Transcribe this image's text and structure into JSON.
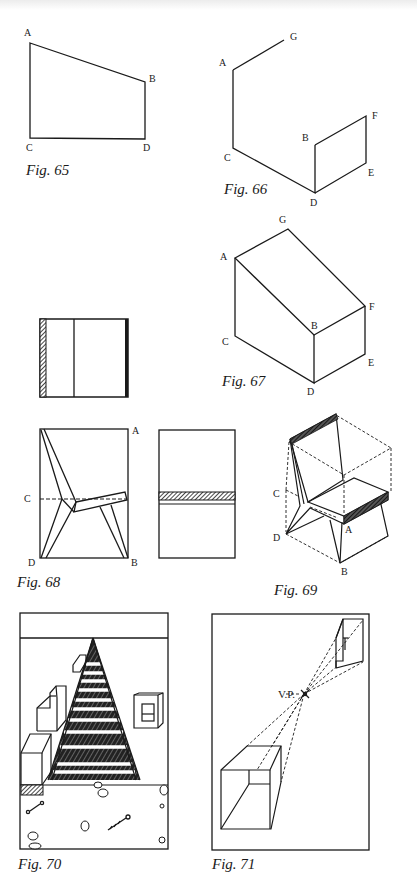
{
  "figures": {
    "fig65": {
      "caption": "Fig. 65",
      "labels": {
        "A": "A",
        "B": "B",
        "C": "C",
        "D": "D"
      }
    },
    "fig66": {
      "caption": "Fig. 66",
      "labels": {
        "A": "A",
        "G": "G",
        "B": "B",
        "F": "F",
        "C": "C",
        "D": "D",
        "E": "E"
      }
    },
    "fig67": {
      "caption": "Fig. 67",
      "labels": {
        "A": "A",
        "G": "G",
        "B": "B",
        "F": "F",
        "C": "C",
        "D": "D",
        "E": "E"
      }
    },
    "fig68": {
      "caption": "Fig. 68",
      "labels": {
        "A": "A",
        "B": "B",
        "C": "C",
        "D": "D"
      }
    },
    "fig69": {
      "caption": "Fig. 69",
      "labels": {
        "A": "A",
        "B": "B",
        "C": "C",
        "D": "D"
      }
    },
    "fig70": {
      "caption": "Fig. 70"
    },
    "fig71": {
      "caption": "Fig. 71",
      "labels": {
        "vp": "V.P."
      }
    }
  },
  "colors": {
    "ink": "#1a1a1a",
    "paper": "#ffffff"
  }
}
